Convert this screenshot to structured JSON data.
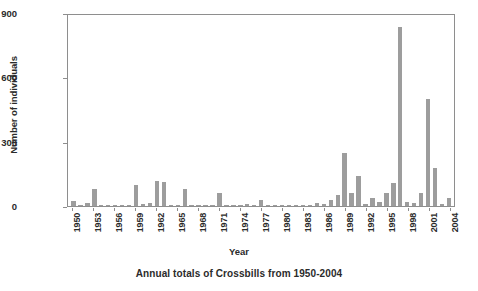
{
  "figure": {
    "caption": "Annual totals of Crossbills from 1950-2004",
    "background": "#ffffff",
    "bar_color": "#9d9d9d",
    "axis_color": "#8e8e8e"
  },
  "chart_data": {
    "type": "bar",
    "title": "",
    "caption": "Annual totals of Crossbills from 1950-2004",
    "xlabel": "Year",
    "ylabel": "Number of individuals",
    "ylim": [
      0,
      900
    ],
    "yticks": [
      0,
      300,
      600,
      900
    ],
    "grid": false,
    "legend": false,
    "xtick_labels": [
      "1950",
      "1953",
      "1956",
      "1959",
      "1962",
      "1965",
      "1968",
      "1971",
      "1974",
      "1977",
      "1980",
      "1983",
      "1986",
      "1989",
      "1992",
      "1995",
      "1998",
      "2001",
      "2004"
    ],
    "xtick_step": 3,
    "categories": [
      "1950",
      "1951",
      "1952",
      "1953",
      "1954",
      "1955",
      "1956",
      "1957",
      "1958",
      "1959",
      "1960",
      "1961",
      "1962",
      "1963",
      "1964",
      "1965",
      "1966",
      "1967",
      "1968",
      "1969",
      "1970",
      "1971",
      "1972",
      "1973",
      "1974",
      "1975",
      "1976",
      "1977",
      "1978",
      "1979",
      "1980",
      "1981",
      "1982",
      "1983",
      "1984",
      "1985",
      "1986",
      "1987",
      "1988",
      "1989",
      "1990",
      "1991",
      "1992",
      "1993",
      "1994",
      "1995",
      "1996",
      "1997",
      "1998",
      "1999",
      "2000",
      "2001",
      "2002",
      "2003",
      "2004"
    ],
    "values": [
      22,
      4,
      14,
      78,
      5,
      3,
      4,
      3,
      6,
      98,
      10,
      12,
      118,
      112,
      6,
      4,
      80,
      5,
      3,
      6,
      4,
      60,
      5,
      3,
      4,
      10,
      3,
      28,
      3,
      2,
      3,
      4,
      3,
      2,
      3,
      16,
      8,
      30,
      50,
      250,
      60,
      140,
      8,
      40,
      18,
      60,
      110,
      845,
      18,
      16,
      60,
      505,
      180,
      10,
      40
    ]
  }
}
